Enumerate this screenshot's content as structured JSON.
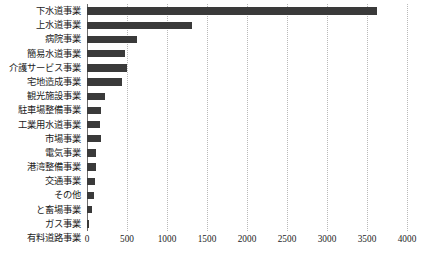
{
  "chart_data": {
    "type": "bar",
    "orientation": "horizontal",
    "title": "",
    "subtitle": "",
    "xlabel": "",
    "ylabel": "",
    "xlim": [
      0,
      4000
    ],
    "ylim": null,
    "grid": true,
    "grid_axis": "x",
    "legend": null,
    "legend_position": "none",
    "bar_color": "#3a3a3a",
    "background_color": "#ffffff",
    "gridline_color": "#b9b9b9",
    "axis_color": "#6e6e6e",
    "xticks": [
      0,
      500,
      1000,
      1500,
      2000,
      2500,
      3000,
      3500,
      4000
    ],
    "xtick_labels": [
      "0",
      "500",
      "1000",
      "1500",
      "2000",
      "2500",
      "3000",
      "3500",
      "4000"
    ],
    "categories": [
      "下水道事業",
      "上水道事業",
      "病院事業",
      "簡易水道事業",
      "介護サービス事業",
      "宅地造成事業",
      "観光施設事業",
      "駐車場整備事業",
      "工業用水道事業",
      "市場事業",
      "電気事業",
      "港湾整備事業",
      "交通事業",
      "その他",
      "と畜場事業",
      "ガス事業",
      "有料道路事業"
    ],
    "values": [
      3620,
      1310,
      625,
      475,
      500,
      440,
      225,
      175,
      165,
      175,
      115,
      110,
      100,
      90,
      65,
      25,
      0
    ]
  }
}
